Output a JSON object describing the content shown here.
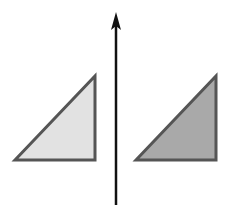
{
  "diagram": {
    "type": "reflection",
    "width": 241,
    "height": 205,
    "background": "#ffffff",
    "axis": {
      "orientation": "vertical",
      "x": 116,
      "y_start": 205,
      "y_end": 12,
      "arrow_direction": "up",
      "color": "#111111"
    },
    "shapes": [
      {
        "id": "left-triangle",
        "kind": "right-triangle",
        "points": [
          [
            15,
            160
          ],
          [
            95,
            76
          ],
          [
            95,
            160
          ]
        ],
        "fill": "#e2e2e2",
        "stroke": "#555555"
      },
      {
        "id": "right-triangle",
        "kind": "right-triangle",
        "points": [
          [
            136,
            160
          ],
          [
            216,
            76
          ],
          [
            216,
            160
          ]
        ],
        "fill": "#a9a9a9",
        "stroke": "#555555"
      }
    ]
  }
}
